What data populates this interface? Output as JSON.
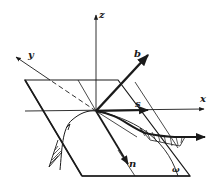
{
  "diagram": {
    "labels": {
      "z_axis": "z",
      "y_axis": "y",
      "x_axis": "x",
      "binormal": "b",
      "tangent": "s",
      "normal": "n",
      "surface": "ω",
      "curve_marker": "r"
    },
    "colors": {
      "ink": "#1a1a1a",
      "background": "#ffffff"
    }
  }
}
